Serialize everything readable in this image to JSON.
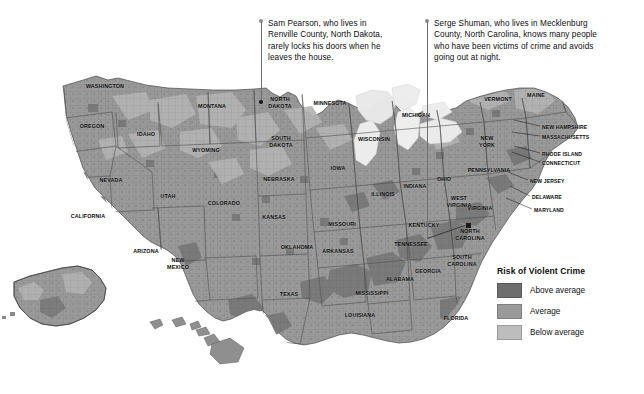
{
  "annotations": [
    {
      "id": "annotation-sam-pearson",
      "text": "Sam Pearson, who lives in\nRenville County, North Dakota,\nrarely locks his doors when he\nleaves the house.",
      "target_state": "North Dakota",
      "target_county": "Renville County"
    },
    {
      "id": "annotation-serge-shuman",
      "text": "Serge Shuman, who lives in Mecklenburg\nCounty, North Carolina, knows many people\nwho have been victims of crime and avoids\ngoing out at night.",
      "target_state": "North Carolina",
      "target_county": "Mecklenburg County"
    }
  ],
  "legend": {
    "title": "Risk of Violent Crime",
    "items": [
      {
        "label": "Above average",
        "color": "#6e6e6e"
      },
      {
        "label": "Average",
        "color": "#9a9a9a"
      },
      {
        "label": "Below average",
        "color": "#bdbdbd"
      }
    ]
  },
  "map": {
    "background": "#ffffff",
    "water_color": "#e8e8e8",
    "border_color": "#555555",
    "state_labels": [
      "WASHINGTON",
      "OREGON",
      "IDAHO",
      "MONTANA",
      "WYOMING",
      "NEVADA",
      "UTAH",
      "CALIFORNIA",
      "ARIZONA",
      "NEW MEXICO",
      "COLORADO",
      "NORTH DAKOTA",
      "SOUTH DAKOTA",
      "NEBRASKA",
      "KANSAS",
      "OKLAHOMA",
      "TEXAS",
      "MINNESOTA",
      "IOWA",
      "MISSOURI",
      "ARKANSAS",
      "LOUISIANA",
      "WISCONSIN",
      "ILLINOIS",
      "MICHIGAN",
      "INDIANA",
      "OHIO",
      "KENTUCKY",
      "TENNESSEE",
      "MISSISSIPPI",
      "ALABAMA",
      "GEORGIA",
      "FLORIDA",
      "SOUTH CAROLINA",
      "NORTH CAROLINA",
      "VIRGINIA",
      "WEST VIRGINIA",
      "MARYLAND",
      "DELAWARE",
      "PENNSYLVANIA",
      "NEW JERSEY",
      "NEW YORK",
      "CONNECTICUT",
      "RHODE ISLAND",
      "MASSACHUSETTS",
      "NEW HAMPSHIRE",
      "VERMONT",
      "MAINE",
      "ALASKA",
      "HAWAII"
    ],
    "insets": [
      "ALASKA",
      "HAWAII"
    ]
  }
}
